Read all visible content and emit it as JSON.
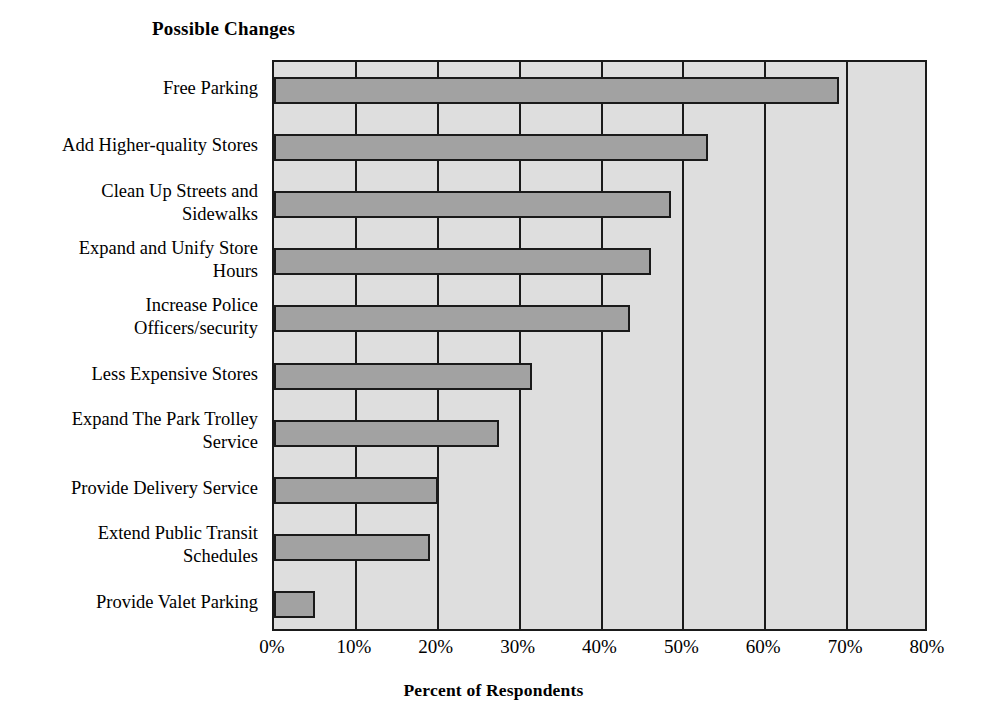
{
  "chart_data": {
    "type": "bar",
    "orientation": "horizontal",
    "title": "Possible Changes",
    "xlabel": "Percent of Respondents",
    "ylabel": "",
    "xlim": [
      0,
      80
    ],
    "xtick_labels": [
      "0%",
      "10%",
      "20%",
      "30%",
      "40%",
      "50%",
      "60%",
      "70%",
      "80%"
    ],
    "xtick_values": [
      0,
      10,
      20,
      30,
      40,
      50,
      60,
      70,
      80
    ],
    "grid": "vertical",
    "legend": "none",
    "categories": [
      "Free Parking",
      "Add Higher-quality Stores",
      "Clean Up Streets and Sidewalks",
      "Expand and Unify Store Hours",
      "Increase Police Officers/security",
      "Less Expensive Stores",
      "Expand The Park Trolley Service",
      "Provide Delivery Service",
      "Extend Public Transit Schedules",
      "Provide Valet Parking"
    ],
    "category_lines": [
      [
        "Free Parking"
      ],
      [
        "Add Higher-quality Stores"
      ],
      [
        "Clean Up Streets and",
        "Sidewalks"
      ],
      [
        "Expand and Unify Store",
        "Hours"
      ],
      [
        "Increase Police",
        "Officers/security"
      ],
      [
        "Less Expensive Stores"
      ],
      [
        "Expand The Park Trolley",
        "Service"
      ],
      [
        "Provide Delivery Service"
      ],
      [
        "Extend Public Transit",
        "Schedules"
      ],
      [
        "Provide Valet Parking"
      ]
    ],
    "values": [
      69,
      53,
      48.5,
      46,
      43.5,
      31.5,
      27.5,
      20,
      19,
      5
    ]
  },
  "style": {
    "bar_fill": "#a2a2a2",
    "bar_border": "#1a1a1a",
    "plot_background": "#dedede",
    "page_background": "#ffffff",
    "text_color": "#000000"
  }
}
